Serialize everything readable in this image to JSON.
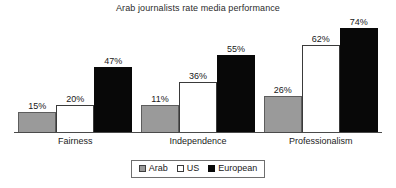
{
  "chart_data": {
    "type": "bar",
    "title": "Arab journalists rate media performance",
    "xlabel": "",
    "ylabel": "",
    "ylim": [
      0,
      80
    ],
    "grid": false,
    "legend_position": "bottom",
    "value_suffix": "%",
    "categories": [
      "Fairness",
      "Independence",
      "Professionalism"
    ],
    "series": [
      {
        "name": "Arab",
        "color": "#9a9a9a",
        "values": [
          15,
          20,
          26
        ]
      },
      {
        "name": "US",
        "color": "#ffffff",
        "values": [
          20,
          36,
          62
        ]
      },
      {
        "name": "European",
        "color": "#080808",
        "values": [
          47,
          55,
          74
        ]
      }
    ],
    "value_labels": [
      [
        "15%",
        "20%",
        "47%"
      ],
      [
        "11%",
        "36%",
        "55%"
      ],
      [
        "26%",
        "62%",
        "74%"
      ]
    ],
    "points": [
      {
        "category": "Fairness",
        "series": "Arab",
        "value": 15,
        "label": "15%"
      },
      {
        "category": "Fairness",
        "series": "US",
        "value": 20,
        "label": "20%"
      },
      {
        "category": "Fairness",
        "series": "European",
        "value": 47,
        "label": "47%"
      },
      {
        "category": "Independence",
        "series": "Arab",
        "value": 11,
        "label": "11%"
      },
      {
        "category": "Independence",
        "series": "US",
        "value": 36,
        "label": "36%"
      },
      {
        "category": "Independence",
        "series": "European",
        "value": 55,
        "label": "55%"
      },
      {
        "category": "Professionalism",
        "series": "Arab",
        "value": 26,
        "label": "26%"
      },
      {
        "category": "Professionalism",
        "series": "US",
        "value": 62,
        "label": "62%"
      },
      {
        "category": "Professionalism",
        "series": "European",
        "value": 74,
        "label": "74%"
      }
    ]
  },
  "legend": {
    "entries": [
      {
        "label": "Arab",
        "swatch": "gray-swatch"
      },
      {
        "label": "US",
        "swatch": "white-swatch"
      },
      {
        "label": "European",
        "swatch": "black-swatch"
      }
    ]
  }
}
